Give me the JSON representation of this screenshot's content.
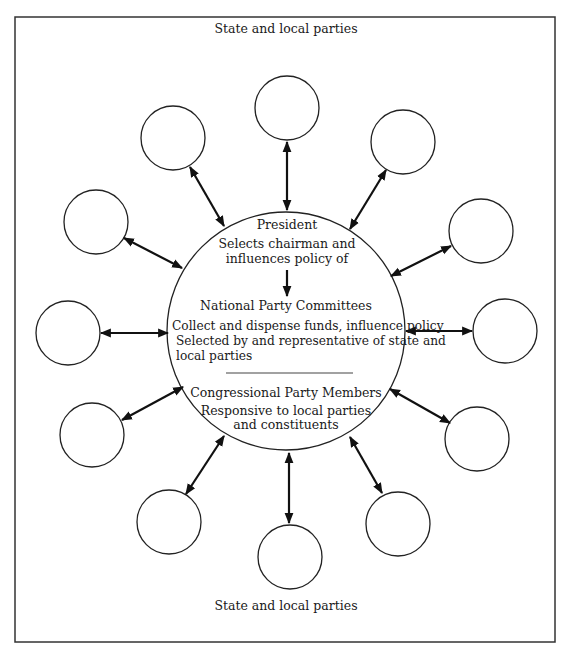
{
  "diagram": {
    "top_label": "State and local parties",
    "bottom_label": "State and local parties",
    "center": {
      "president": {
        "title": "President",
        "lines": [
          "Selects chairman and",
          "influences policy of"
        ]
      },
      "national_committees": {
        "title": "National Party Committees",
        "lines": [
          "Collect and dispense funds, influence policy",
          "Selected by and representative of state and",
          "local parties"
        ]
      },
      "congressional_members": {
        "title": "Congressional Party Members",
        "lines": [
          "Responsive to local parties",
          "and constituents"
        ]
      }
    },
    "satellite_count": 12,
    "satellite_label": "state-local-party-circle",
    "relationship": "two-way arrows between each state/local party and the central national party"
  }
}
